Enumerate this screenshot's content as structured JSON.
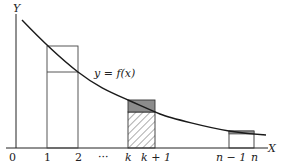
{
  "figure": {
    "axis_labels": {
      "y": "Y",
      "x": "X"
    },
    "curve_label": "y = f(x)",
    "ticks": [
      {
        "label": "0",
        "italic": false
      },
      {
        "label": "1",
        "italic": false
      },
      {
        "label": "2",
        "italic": false
      },
      {
        "label": "···",
        "italic": false
      },
      {
        "label": "k",
        "italic": true
      },
      {
        "label": "k + 1",
        "italic": true
      },
      {
        "label": "n − 1",
        "italic": true
      },
      {
        "label": "n",
        "italic": true
      }
    ],
    "colors": {
      "stroke": "#222222",
      "shade": "#8c8c8c",
      "background": "#ffffff"
    },
    "rectangles": [
      {
        "interval": "[1, 2]",
        "style": "upper and lower rectangles outlined"
      },
      {
        "interval": "[k, k+1]",
        "style": "difference shaded grey, lower rectangle hatched"
      },
      {
        "interval": "[n-1, n]",
        "style": "small difference shaded"
      }
    ]
  }
}
